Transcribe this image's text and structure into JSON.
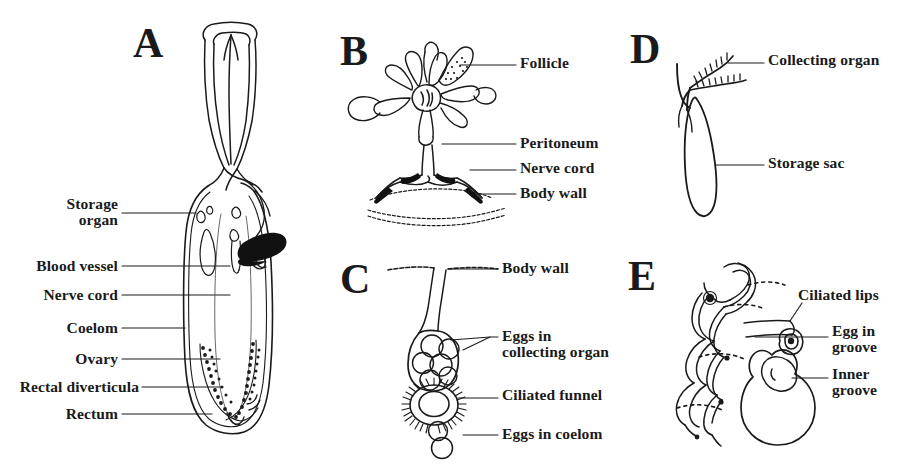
{
  "figure": {
    "background": "#ffffff",
    "ink": "#1a1a1a",
    "width": 924,
    "height": 468
  },
  "panels": [
    {
      "letter": "A",
      "name": "whole-animal-sagittal-section",
      "labels": [
        {
          "id": "storage-organ",
          "text": "Storage\norgan",
          "side": "left"
        },
        {
          "id": "blood-vessel",
          "text": "Blood vessel",
          "side": "left"
        },
        {
          "id": "nerve-cord",
          "text": "Nerve cord",
          "side": "left"
        },
        {
          "id": "coelom",
          "text": "Coelom",
          "side": "left"
        },
        {
          "id": "ovary",
          "text": "Ovary",
          "side": "left"
        },
        {
          "id": "rectal-diverticula",
          "text": "Rectal diverticula",
          "side": "left"
        },
        {
          "id": "rectum",
          "text": "Rectum",
          "side": "left"
        }
      ]
    },
    {
      "letter": "B",
      "name": "follicle-rosette-on-nerve-cord",
      "labels": [
        {
          "id": "follicle",
          "text": "Follicle",
          "side": "right"
        },
        {
          "id": "peritoneum",
          "text": "Peritoneum",
          "side": "right"
        },
        {
          "id": "nerve-cord",
          "text": "Nerve cord",
          "side": "right"
        },
        {
          "id": "body-wall",
          "text": "Body wall",
          "side": "right"
        }
      ]
    },
    {
      "letter": "C",
      "name": "collecting-organ-with-ciliated-funnel",
      "labels": [
        {
          "id": "body-wall",
          "text": "Body wall",
          "side": "right"
        },
        {
          "id": "eggs-in-collecting-organ",
          "text": "Eggs in\ncollecting organ",
          "side": "right"
        },
        {
          "id": "ciliated-funnel",
          "text": "Ciliated funnel",
          "side": "right"
        },
        {
          "id": "eggs-in-coelom",
          "text": "Eggs in coelom",
          "side": "right"
        }
      ]
    },
    {
      "letter": "D",
      "name": "collecting-organ-and-storage-sac",
      "labels": [
        {
          "id": "collecting-organ",
          "text": "Collecting organ",
          "side": "right"
        },
        {
          "id": "storage-sac",
          "text": "Storage sac",
          "side": "right"
        }
      ]
    },
    {
      "letter": "E",
      "name": "ciliated-funnel-spiral-detail",
      "labels": [
        {
          "id": "ciliated-lips",
          "text": "Ciliated lips",
          "side": "right"
        },
        {
          "id": "egg-in-groove",
          "text": "Egg in\ngroove",
          "side": "right"
        },
        {
          "id": "inner-groove",
          "text": "Inner\ngroove",
          "side": "right"
        }
      ]
    }
  ]
}
